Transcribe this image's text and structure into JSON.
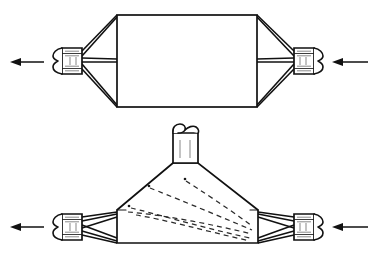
{
  "figure": {
    "background_color": "#ffffff",
    "line_color": "#111111",
    "dash_color": "#2a2a2a",
    "width": 376,
    "height": 264,
    "view_count": 2
  },
  "views": [
    {
      "id": "top-view",
      "label": "Rectangular plenum view",
      "body": {
        "shape": "rectangle",
        "x": 117,
        "y": 15,
        "width": 140,
        "height": 92
      },
      "left_fitting": {
        "label": "Left cylindrical end fitting",
        "x": 48,
        "y": 46,
        "width": 34,
        "height": 28,
        "orientation": "left",
        "clamp_bands": 2
      },
      "right_fitting": {
        "label": "Right cylindrical end fitting",
        "x": 294,
        "y": 46,
        "width": 34,
        "height": 28,
        "orientation": "right",
        "clamp_bands": 2
      },
      "left_arrow": {
        "label": "Outlet airflow arrow",
        "direction": "left",
        "x1": 44,
        "x2": 10,
        "y": 62
      },
      "right_arrow": {
        "label": "Inlet airflow arrow",
        "direction": "left",
        "x1": 368,
        "x2": 332,
        "y": 62
      },
      "taper_line_count": 8
    },
    {
      "id": "bottom-view",
      "label": "Pentagonal hopper view with top stack",
      "body": {
        "shape": "pentagon-with-skirt",
        "left_x": 117,
        "right_x": 258,
        "shoulder_y": 210,
        "bottom_y": 243,
        "apex_left_x": 173,
        "apex_right_x": 198,
        "apex_y": 163
      },
      "stack": {
        "label": "Top stack tube",
        "x": 173,
        "y": 127,
        "width": 25,
        "height": 36,
        "has_rolled_top": true,
        "rib_count": 2
      },
      "left_fitting": {
        "label": "Left cylindrical end fitting",
        "x": 48,
        "y": 212,
        "width": 34,
        "height": 28,
        "orientation": "left",
        "clamp_bands": 2
      },
      "right_fitting": {
        "label": "Right cylindrical end fitting",
        "x": 294,
        "y": 212,
        "width": 34,
        "height": 28,
        "orientation": "right",
        "clamp_bands": 2
      },
      "left_arrow": {
        "label": "Outlet airflow arrow",
        "direction": "left",
        "x1": 44,
        "x2": 10,
        "y": 227
      },
      "right_arrow": {
        "label": "Inlet airflow arrow",
        "direction": "left",
        "x1": 368,
        "x2": 332,
        "y": 227
      },
      "flow_lines": {
        "label": "Internal airflow streamlines",
        "count": 5,
        "style": "dashed",
        "has_origin_dots": true,
        "origin_dot_count": 3,
        "paths": [
          "M 131 208 C 150 212 195 226 250 238",
          "M 136 215 C 162 219 206 231 250 241",
          "M 128 212 C 165 215 215 225 252 234",
          "M 150 188 C 168 195 212 213 252 230",
          "M 186 181 C 200 190 228 208 252 226"
        ],
        "origin_dots": [
          {
            "x": 129,
            "y": 206
          },
          {
            "x": 149,
            "y": 186
          },
          {
            "x": 185,
            "y": 179
          }
        ]
      },
      "taper_line_count": 8
    }
  ],
  "annotations": {
    "airflow_in_label": "inlet",
    "airflow_out_label": "outlet"
  }
}
